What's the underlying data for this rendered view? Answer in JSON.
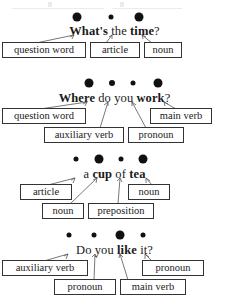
{
  "document": {
    "type": "grammar-stress-pattern-worksheet",
    "description": "Four example questions/phrases with stress dots above and part-of-speech labels below",
    "page_background": "#ffffff",
    "ink_color": "#1a1a1a",
    "box_border_color": "#333333"
  },
  "rows": [
    {
      "id": "row-1",
      "sentence_parts": [
        {
          "text": "What's",
          "bold": true
        },
        {
          "text": " the ",
          "bold": false
        },
        {
          "text": "time",
          "bold": true
        },
        {
          "text": "?",
          "bold": false
        }
      ],
      "sentence_plain": "What's the time?",
      "dots": [
        {
          "size": "large",
          "x": 77
        },
        {
          "size": "small",
          "x": 111
        },
        {
          "size": "large",
          "x": 139
        }
      ],
      "labels": [
        {
          "text": "question word",
          "tier": 1
        },
        {
          "text": "article",
          "tier": 1
        },
        {
          "text": "noun",
          "tier": 1
        }
      ]
    },
    {
      "id": "row-2",
      "sentence_parts": [
        {
          "text": "Where",
          "bold": true
        },
        {
          "text": " do you ",
          "bold": false
        },
        {
          "text": "work",
          "bold": true
        },
        {
          "text": "?",
          "bold": false
        }
      ],
      "sentence_plain": "Where do you work?",
      "dots": [
        {
          "size": "large",
          "x": 89
        },
        {
          "size": "medium",
          "x": 112
        },
        {
          "size": "small",
          "x": 133
        },
        {
          "size": "large",
          "x": 158
        }
      ],
      "labels": [
        {
          "text": "question word",
          "tier": 1
        },
        {
          "text": "main verb",
          "tier": 1
        },
        {
          "text": "auxiliary verb",
          "tier": 2
        },
        {
          "text": "pronoun",
          "tier": 2
        }
      ]
    },
    {
      "id": "row-3",
      "sentence_parts": [
        {
          "text": "a ",
          "bold": false
        },
        {
          "text": "cup",
          "bold": true
        },
        {
          "text": " of ",
          "bold": false
        },
        {
          "text": "tea",
          "bold": true
        }
      ],
      "sentence_plain": "a cup of tea",
      "dots": [
        {
          "size": "small",
          "x": 76
        },
        {
          "size": "large",
          "x": 99
        },
        {
          "size": "small",
          "x": 121
        },
        {
          "size": "large",
          "x": 143
        }
      ],
      "labels": [
        {
          "text": "article",
          "tier": 1
        },
        {
          "text": "noun",
          "tier": 1
        },
        {
          "text": "noun",
          "tier": 2
        },
        {
          "text": "preposition",
          "tier": 2
        }
      ]
    },
    {
      "id": "row-4",
      "sentence_parts": [
        {
          "text": "Do you ",
          "bold": false
        },
        {
          "text": "like",
          "bold": true
        },
        {
          "text": " it?",
          "bold": false
        }
      ],
      "sentence_plain": "Do you like it?",
      "dots": [
        {
          "size": "small",
          "x": 69
        },
        {
          "size": "small",
          "x": 94
        },
        {
          "size": "large",
          "x": 120
        },
        {
          "size": "small",
          "x": 143
        }
      ],
      "labels": [
        {
          "text": "auxiliary verb",
          "tier": 1
        },
        {
          "text": "pronoun",
          "tier": 1
        },
        {
          "text": "pronoun",
          "tier": 2
        },
        {
          "text": "main verb",
          "tier": 2
        }
      ]
    }
  ]
}
